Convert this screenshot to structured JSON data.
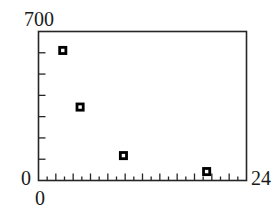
{
  "chart_data": {
    "type": "scatter",
    "title": "",
    "xlabel": "",
    "ylabel": "",
    "xlim": [
      0,
      24
    ],
    "ylim": [
      0,
      700
    ],
    "grid": false,
    "legend": null,
    "marker_style": "filled-square-with-white-center",
    "x_major_tick_interval": 2,
    "x_minor_tick_interval": 1,
    "y_major_tick_interval": 100,
    "points": [
      {
        "x": 2.8,
        "y": 611
      },
      {
        "x": 4.8,
        "y": 345
      },
      {
        "x": 9.8,
        "y": 117
      },
      {
        "x": 19.4,
        "y": 42
      }
    ],
    "x": [
      2.8,
      4.8,
      9.8,
      19.4
    ],
    "values": [
      611,
      345,
      117,
      42
    ]
  },
  "axes": {
    "y_max_label": "700",
    "y_min_label": "0",
    "x_min_label": "0",
    "x_max_label": "24"
  },
  "style": {
    "frame_color": "#262626",
    "marker_color": "#000000",
    "marker_inner_color": "#ffffff",
    "background": "#ffffff"
  }
}
